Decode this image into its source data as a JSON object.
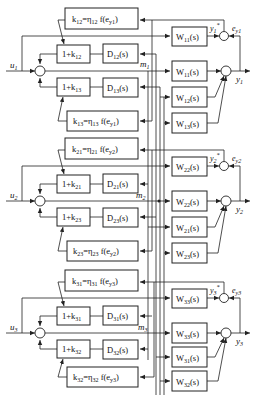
{
  "diagram": {
    "type": "block-diagram",
    "sections": [
      {
        "input": "u1",
        "output": "y1",
        "error": "ey1",
        "ref_output": "y1*",
        "m_label": "m1",
        "gain_top": "k12=η12 f(ey1)",
        "gain_bottom": "k13=η13 f(ey1)",
        "one_plus_top": "1+k12",
        "one_plus_bottom": "1+k13",
        "decoupler_top": "D*12(s)",
        "decoupler_bottom": "D*13(s)",
        "model": "W*11(s)",
        "plants": [
          "W11(s)",
          "W12(s)",
          "W13(s)"
        ]
      },
      {
        "input": "u2",
        "output": "y2",
        "error": "ey2",
        "ref_output": "y2*",
        "m_label": "m2",
        "gain_top": "k21=η21 f(ey2)",
        "gain_bottom": "k23=η23 f(ey2)",
        "one_plus_top": "1+k21",
        "one_plus_bottom": "1+k23",
        "decoupler_top": "D*21(s)",
        "decoupler_bottom": "D*23(s)",
        "model": "W*22(s)",
        "plants": [
          "W22(s)",
          "W21(s)",
          "W23(s)"
        ]
      },
      {
        "input": "u3",
        "output": "y3",
        "error": "ey3",
        "ref_output": "y3*",
        "m_label": "m3",
        "gain_top": "k31=η31 f(ey3)",
        "gain_bottom": "k32=η32 f(ey3)",
        "one_plus_top": "1+k31",
        "one_plus_bottom": "1+k32",
        "decoupler_top": "D*31(s)",
        "decoupler_bottom": "D*32(s)",
        "model": "W*33(s)",
        "plants": [
          "W33(s)",
          "W31(s)",
          "W32(s)"
        ]
      }
    ]
  },
  "labels": {
    "s0": {
      "u": "u",
      "ui": "1",
      "y": "y",
      "yi": "1",
      "e": "e",
      "ei": "y1",
      "m": "m",
      "mi": "1",
      "kt": "k",
      "kti": "12",
      "kte": "=η",
      "ktei": "12",
      "ktf": " f(e",
      "ktfi": "y1",
      "ktc": ")",
      "kb": "k",
      "kbi": "13",
      "kbe": "=η",
      "kbei": "13",
      "kbf": " f(e",
      "kbfi": "y1",
      "kbc": ")",
      "opt": "1+k",
      "opti": "12",
      "opb": "1+k",
      "opbi": "13",
      "dt": "D",
      "dti": "12",
      "db": "D",
      "dbi": "13",
      "wm": "W",
      "wmi": "11",
      "p0": "W",
      "p0i": "11",
      "p1": "W",
      "p1i": "12",
      "p2": "W",
      "p2i": "13",
      "sfx": "(s)"
    },
    "s1": {
      "u": "u",
      "ui": "2",
      "y": "y",
      "yi": "2",
      "e": "e",
      "ei": "y2",
      "m": "m",
      "mi": "2",
      "kt": "k",
      "kti": "21",
      "kte": "=η",
      "ktei": "21",
      "ktf": " f(e",
      "ktfi": "y2",
      "ktc": ")",
      "kb": "k",
      "kbi": "23",
      "kbe": "=η",
      "kbei": "23",
      "kbf": " f(e",
      "kbfi": "y2",
      "kbc": ")",
      "opt": "1+k",
      "opti": "21",
      "opb": "1+k",
      "opbi": "23",
      "dt": "D",
      "dti": "21",
      "db": "D",
      "dbi": "23",
      "wm": "W",
      "wmi": "22",
      "p0": "W",
      "p0i": "22",
      "p1": "W",
      "p1i": "21",
      "p2": "W",
      "p2i": "23",
      "sfx": "(s)"
    },
    "s2": {
      "u": "u",
      "ui": "3",
      "y": "y",
      "yi": "3",
      "e": "e",
      "ei": "y3",
      "m": "m",
      "mi": "3",
      "kt": "k",
      "kti": "31",
      "kte": "=η",
      "ktei": "31",
      "ktf": " f(e",
      "ktfi": "y3",
      "ktc": ")",
      "kb": "k",
      "kbi": "32",
      "kbe": "=η",
      "kbei": "32",
      "kbf": " f(e",
      "kbfi": "y3",
      "kbc": ")",
      "opt": "1+k",
      "opti": "31",
      "opb": "1+k",
      "opbi": "32",
      "dt": "D",
      "dti": "31",
      "db": "D",
      "dbi": "32",
      "wm": "W",
      "wmi": "33",
      "p0": "W",
      "p0i": "33",
      "p1": "W",
      "p1i": "31",
      "p2": "W",
      "p2i": "32",
      "sfx": "(s)"
    }
  },
  "colors": {
    "line": "#222222",
    "background": "#ffffff"
  }
}
